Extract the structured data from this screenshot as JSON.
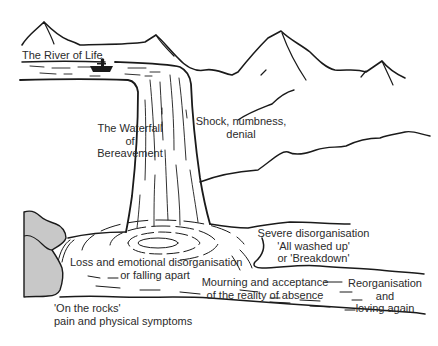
{
  "title": "The River of Life",
  "colors": {
    "ink": "#1a1a1a",
    "text": "#2b2b2b",
    "rocks_fill": "#c8c8c8",
    "background": "#ffffff"
  },
  "labels": {
    "river": "The River of Life",
    "waterfall": [
      "The Waterfall",
      "of",
      "Bereavement"
    ],
    "shock": [
      "Shock, numbness,",
      "denial"
    ],
    "severe": [
      "Severe disorganisation",
      "'All washed up'",
      "or 'Breakdown'"
    ],
    "loss": [
      "Loss and emotional disorganisation",
      "or falling apart"
    ],
    "mourning": [
      "Mourning and acceptance",
      "of the reality of absence"
    ],
    "reorganisation": [
      "Reorganisation",
      "and",
      "loving again"
    ],
    "rocks": [
      "'On the rocks'",
      "pain and physical symptoms"
    ]
  },
  "icons": {
    "boat": "boat-with-person-icon",
    "mountains": "mountain-range-icon",
    "rocks": "rocks-icon",
    "ripples": "water-ripples-icon"
  }
}
